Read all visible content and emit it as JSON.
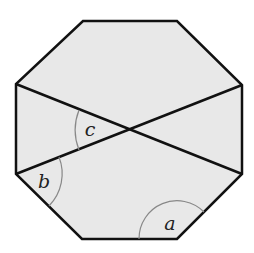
{
  "diagram": {
    "shape": "regular-octagon",
    "fill_color": "#e8e8e8",
    "stroke_color": "#111111",
    "arc_color": "#888888",
    "vertices": [
      [
        83,
        21
      ],
      [
        177,
        21
      ],
      [
        242,
        85
      ],
      [
        242,
        174
      ],
      [
        177,
        239
      ],
      [
        82,
        239
      ],
      [
        16,
        174
      ],
      [
        16,
        84
      ]
    ],
    "diagonals": [
      {
        "from": [
          16,
          84
        ],
        "to": [
          242,
          174
        ]
      },
      {
        "from": [
          16,
          174
        ],
        "to": [
          242,
          85
        ]
      }
    ],
    "intersection": [
      130,
      130
    ],
    "angles": [
      {
        "label": "a",
        "vertex": [
          177,
          239
        ],
        "position": [
          170,
          230
        ]
      },
      {
        "label": "b",
        "vertex": [
          16,
          174
        ],
        "position": [
          44,
          188
        ]
      },
      {
        "label": "c",
        "vertex": [
          130,
          130
        ],
        "position": [
          90,
          136
        ]
      }
    ]
  }
}
